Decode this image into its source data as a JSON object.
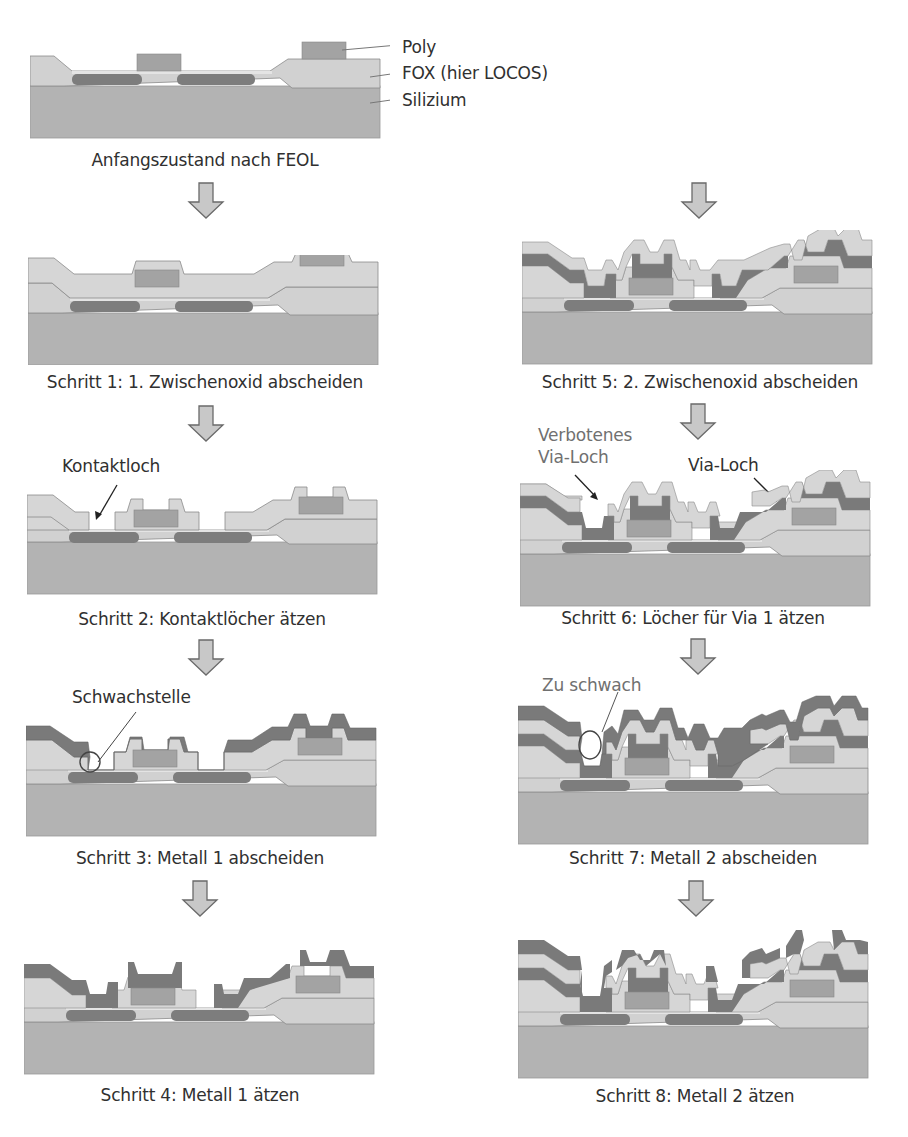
{
  "colors": {
    "silicon": "#b3b3b3",
    "fox": "#d1d1d1",
    "oxide": "#d6d6d6",
    "poly": "#a3a3a3",
    "diffusion": "#7d7d7d",
    "metal": "#7a7a7a",
    "outline": "#8a8a8a",
    "arrow_fill": "#c8c8c8",
    "arrow_stroke": "#6a6a6a",
    "text": "#303030",
    "grey_text": "#707070"
  },
  "legend": {
    "poly": "Poly",
    "fox": "FOX (hier LOCOS)",
    "silicon": "Silizium"
  },
  "steps": [
    {
      "id": "step0",
      "caption": "Anfangszustand nach FEOL"
    },
    {
      "id": "step1",
      "caption": "Schritt 1: 1. Zwischenoxid abscheiden"
    },
    {
      "id": "step2",
      "caption": "Schritt 2: Kontaktlöcher ätzen"
    },
    {
      "id": "step3",
      "caption": "Schritt 3: Metall 1 abscheiden"
    },
    {
      "id": "step4",
      "caption": "Schritt 4: Metall 1 ätzen"
    },
    {
      "id": "step5",
      "caption": "Schritt 5: 2. Zwischenoxid abscheiden"
    },
    {
      "id": "step6",
      "caption": "Schritt 6: Löcher für Via 1 ätzen"
    },
    {
      "id": "step7",
      "caption": "Schritt 7: Metall 2 abscheiden"
    },
    {
      "id": "step8",
      "caption": "Schritt 8: Metall 2 ätzen"
    }
  ],
  "annotations": {
    "kontaktloch": "Kontaktloch",
    "schwachstelle": "Schwachstelle",
    "verbotenes_line1": "Verbotenes",
    "verbotenes_line2": "Via-Loch",
    "via_loch": "Via-Loch",
    "zu_schwach": "Zu schwach"
  }
}
